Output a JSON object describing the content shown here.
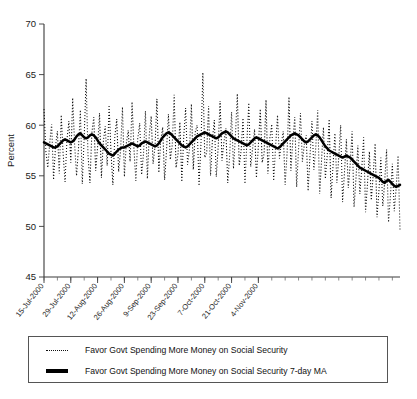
{
  "chart_data": {
    "type": "line",
    "title": "",
    "xlabel": "",
    "ylabel": "Percent",
    "ylim": [
      45,
      70
    ],
    "yticks": [
      45,
      50,
      55,
      60,
      65,
      70
    ],
    "grid": false,
    "legend_position": "bottom",
    "x_tick_labels": [
      "15-Jul-2000",
      "29-Jul-2000",
      "12-Aug-2000",
      "26-Aug-2000",
      "9-Sep-2000",
      "23-Sep-2000",
      "7-Oct-2000",
      "21-Oct-2000",
      "4-Nov-2000"
    ],
    "x_start": "15-Jul-2000",
    "x_end": "11-Nov-2000",
    "x_tick_interval_days": 14,
    "x_minor_tick_interval_days": 7,
    "series": [
      {
        "name": "Favor Govt Spending More Money on Social Security",
        "style": "dotted",
        "color": "#111111",
        "values": [
          61.6,
          57.4,
          55.8,
          58.3,
          60.1,
          54.6,
          57.9,
          59.4,
          55.2,
          61.0,
          57.2,
          54.4,
          58.6,
          60.4,
          56.3,
          62.7,
          58.1,
          55.0,
          57.6,
          61.5,
          54.2,
          58.8,
          64.6,
          57.0,
          54.3,
          59.2,
          60.8,
          55.5,
          57.8,
          61.2,
          54.8,
          58.4,
          59.9,
          56.0,
          62.0,
          57.3,
          54.1,
          58.9,
          60.6,
          55.4,
          57.5,
          61.8,
          54.9,
          58.2,
          59.5,
          56.4,
          62.3,
          57.7,
          54.5,
          58.7,
          60.2,
          55.1,
          57.2,
          61.4,
          54.7,
          59.0,
          60.9,
          56.2,
          57.9,
          62.6,
          55.3,
          58.5,
          59.8,
          54.6,
          57.4,
          61.1,
          56.6,
          58.0,
          63.0,
          55.8,
          57.1,
          60.3,
          54.4,
          58.8,
          61.7,
          56.1,
          57.6,
          62.1,
          55.6,
          59.3,
          60.0,
          54.0,
          58.1,
          65.2,
          56.8,
          57.3,
          61.9,
          55.0,
          58.6,
          60.5,
          54.9,
          57.8,
          62.4,
          56.5,
          58.3,
          59.7,
          54.3,
          57.0,
          61.3,
          55.7,
          58.9,
          63.1,
          56.0,
          57.5,
          60.7,
          54.2,
          58.4,
          62.2,
          55.9,
          57.7,
          59.6,
          54.8,
          58.0,
          61.6,
          56.3,
          57.2,
          62.5,
          55.2,
          58.7,
          60.1,
          54.5,
          57.9,
          61.0,
          56.7,
          58.2,
          59.4,
          54.1,
          57.3,
          62.8,
          55.5,
          58.5,
          60.8,
          53.9,
          57.6,
          61.2,
          56.4,
          58.1,
          59.0,
          53.5,
          57.0,
          60.4,
          55.6,
          57.8,
          61.5,
          53.2,
          56.5,
          59.8,
          54.7,
          57.1,
          60.6,
          52.8,
          56.0,
          59.2,
          54.3,
          56.8,
          60.0,
          52.4,
          55.4,
          58.6,
          53.8,
          56.2,
          59.4,
          51.9,
          54.8,
          58.0,
          53.2,
          55.6,
          58.8,
          51.4,
          54.2,
          57.4,
          52.6,
          55.0,
          58.2,
          50.9,
          53.6,
          56.8,
          52.0,
          54.4,
          57.6,
          50.4,
          53.0,
          56.2,
          51.5,
          53.8,
          57.0,
          49.7
        ],
        "min": 49.7,
        "max": 65.2
      },
      {
        "name": "Favor Govt Spending More Money on Social Security 7-day MA",
        "style": "solid",
        "color": "#000000",
        "values": [
          58.3,
          58.2,
          58.1,
          58.0,
          57.9,
          57.8,
          57.8,
          57.9,
          58.1,
          58.3,
          58.5,
          58.6,
          58.5,
          58.4,
          58.3,
          58.4,
          58.6,
          58.9,
          59.1,
          59.2,
          59.0,
          58.8,
          58.7,
          58.8,
          59.0,
          59.1,
          59.0,
          58.8,
          58.5,
          58.2,
          58.0,
          57.8,
          57.6,
          57.4,
          57.2,
          57.1,
          57.0,
          57.2,
          57.4,
          57.6,
          57.7,
          57.8,
          57.8,
          57.9,
          58.0,
          58.1,
          58.2,
          58.1,
          58.0,
          57.9,
          58.0,
          58.2,
          58.3,
          58.4,
          58.3,
          58.2,
          58.1,
          58.0,
          57.9,
          58.0,
          58.2,
          58.5,
          58.8,
          59.0,
          59.2,
          59.3,
          59.2,
          59.0,
          58.8,
          58.6,
          58.4,
          58.2,
          58.0,
          57.9,
          57.8,
          57.9,
          58.1,
          58.3,
          58.5,
          58.7,
          58.9,
          59.0,
          59.1,
          59.2,
          59.3,
          59.2,
          59.1,
          59.0,
          58.9,
          58.8,
          58.7,
          58.8,
          59.0,
          59.2,
          59.3,
          59.4,
          59.3,
          59.1,
          58.9,
          58.7,
          58.6,
          58.5,
          58.4,
          58.3,
          58.2,
          58.1,
          58.0,
          58.1,
          58.3,
          58.5,
          58.7,
          58.8,
          58.7,
          58.6,
          58.5,
          58.4,
          58.3,
          58.2,
          58.1,
          58.0,
          57.9,
          57.8,
          57.7,
          57.8,
          58.0,
          58.2,
          58.4,
          58.6,
          58.8,
          59.0,
          59.1,
          59.2,
          59.1,
          59.0,
          58.8,
          58.6,
          58.4,
          58.3,
          58.4,
          58.6,
          58.8,
          59.0,
          59.1,
          59.0,
          58.8,
          58.5,
          58.2,
          57.9,
          57.7,
          57.5,
          57.4,
          57.3,
          57.2,
          57.1,
          57.0,
          56.9,
          56.8,
          56.9,
          57.0,
          56.9,
          56.8,
          56.6,
          56.4,
          56.2,
          56.0,
          55.8,
          55.7,
          55.6,
          55.5,
          55.4,
          55.3,
          55.2,
          55.1,
          55.0,
          54.9,
          54.8,
          54.6,
          54.4,
          54.3,
          54.5,
          54.6,
          54.4,
          54.2,
          54.0,
          53.9,
          54.0,
          54.1
        ],
        "min": 53.9,
        "max": 59.4
      }
    ]
  },
  "legend": {
    "entries": [
      {
        "label": "Favor Govt Spending More Money on Social Security",
        "marker": "dotted-line-icon"
      },
      {
        "label": "Favor Govt Spending More Money on Social Security 7-day MA",
        "marker": "solid-line-icon"
      }
    ]
  }
}
